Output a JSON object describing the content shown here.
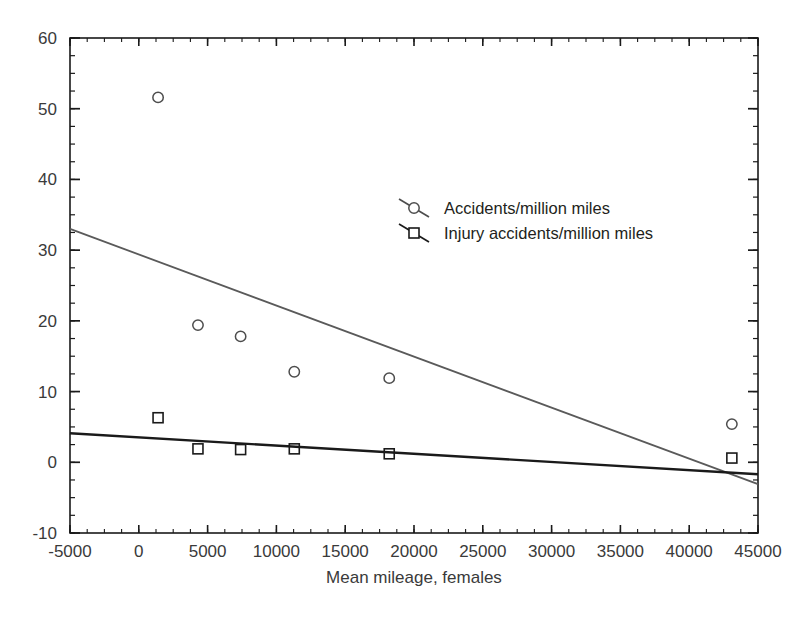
{
  "chart_data": {
    "type": "scatter",
    "title": "",
    "subtitle": "",
    "xlabel": "Mean mileage, females",
    "ylabel": "",
    "xlim": [
      -5000,
      45000
    ],
    "ylim": [
      -10,
      60
    ],
    "xticks": [
      -5000,
      0,
      5000,
      10000,
      15000,
      20000,
      25000,
      30000,
      35000,
      40000,
      45000
    ],
    "xtick_labels": [
      "-5000",
      "0",
      "5000",
      "10000",
      "15000",
      "20000",
      "25000",
      "30000",
      "35000",
      "40000",
      "45000"
    ],
    "yticks": [
      -10,
      0,
      10,
      20,
      30,
      40,
      50,
      60
    ],
    "ytick_labels": [
      "-10",
      "0",
      "10",
      "20",
      "30",
      "40",
      "50",
      "60"
    ],
    "x_minor_tick_step": 1250,
    "y_minor_tick_step": 2.5,
    "grid": false,
    "legend_position": "upper-center-right",
    "frame": true,
    "series": [
      {
        "name": "Accidents/million miles",
        "marker": "circle",
        "marker_color": "#4d4d4d",
        "trendline_color": "#5a5a5a",
        "x": [
          1400,
          4300,
          7400,
          11300,
          18200,
          43100
        ],
        "y": [
          51.6,
          19.4,
          17.8,
          12.8,
          11.9,
          5.4
        ],
        "trendline": {
          "x": [
            -5000,
            45000
          ],
          "y": [
            33.0,
            -3.1
          ]
        }
      },
      {
        "name": "Injury accidents/million miles",
        "marker": "square",
        "marker_color": "#1a1a1a",
        "trendline_color": "#1a1a1a",
        "x": [
          1400,
          4300,
          7400,
          11300,
          18200,
          43100
        ],
        "y": [
          6.3,
          1.9,
          1.8,
          1.9,
          1.2,
          0.6
        ],
        "trendline": {
          "x": [
            -5000,
            45000
          ],
          "y": [
            4.1,
            -1.7
          ]
        }
      }
    ]
  },
  "legend": {
    "entries": [
      {
        "label": "Accidents/million miles",
        "marker": "circle-marker"
      },
      {
        "label": "Injury accidents/million miles",
        "marker": "square-marker"
      }
    ]
  },
  "axes": {
    "x_title": "Mean mileage, females"
  },
  "colors": {
    "axis": "#1a1a1a",
    "text": "#3a3a3a",
    "series_1": "#5a5a5a",
    "series_2": "#1a1a1a",
    "background": "#ffffff"
  }
}
